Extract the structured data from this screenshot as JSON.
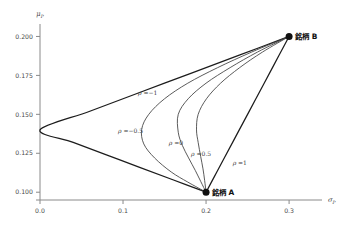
{
  "chart_data": {
    "type": "line",
    "title": "",
    "xlabel": "σP",
    "ylabel": "μP",
    "xlim": [
      0.0,
      0.33
    ],
    "ylim": [
      0.095,
      0.208
    ],
    "grid": false,
    "legend_position": "inline-annotations",
    "x_ticks": [
      "0.0",
      "0.1",
      "0.2",
      "0.3"
    ],
    "x_tick_values": [
      0.0,
      0.1,
      0.2,
      0.3
    ],
    "y_ticks": [
      "0.100",
      "0.125",
      "0.150",
      "0.175",
      "0.200"
    ],
    "y_tick_values": [
      0.1,
      0.125,
      0.15,
      0.175,
      0.2
    ],
    "points": [
      {
        "name": "銘柄 A",
        "x": 0.2,
        "y": 0.1
      },
      {
        "name": "銘柄 B",
        "x": 0.3,
        "y": 0.2
      }
    ],
    "series": [
      {
        "name": "ρ = −1",
        "rho": -1,
        "label": "ρ =−1",
        "x": [
          0.3,
          0.24,
          0.18,
          0.12,
          0.06,
          0.0,
          0.04,
          0.08,
          0.12,
          0.16,
          0.2
        ],
        "y": [
          0.2,
          0.188,
          0.176,
          0.164,
          0.152,
          0.14,
          0.132,
          0.124,
          0.116,
          0.108,
          0.1
        ]
      },
      {
        "name": "ρ = −0.5",
        "rho": -0.5,
        "label": "ρ =−0.5",
        "x": [
          0.3,
          0.255,
          0.214,
          0.178,
          0.15,
          0.131,
          0.1225,
          0.125,
          0.138,
          0.158,
          0.178,
          0.2
        ],
        "y": [
          0.2,
          0.19,
          0.18,
          0.17,
          0.16,
          0.15,
          0.1405,
          0.131,
          0.122,
          0.113,
          0.1065,
          0.1
        ]
      },
      {
        "name": "ρ = 0",
        "rho": 0,
        "label": "ρ =0",
        "x": [
          0.3,
          0.262,
          0.229,
          0.2,
          0.1785,
          0.1665,
          0.1665,
          0.1715,
          0.179,
          0.187,
          0.1935,
          0.2
        ],
        "y": [
          0.2,
          0.19,
          0.18,
          0.17,
          0.16,
          0.15,
          0.1385,
          0.13,
          0.122,
          0.114,
          0.107,
          0.1
        ]
      },
      {
        "name": "ρ = 0.5",
        "rho": 0.5,
        "label": "ρ =0.5",
        "x": [
          0.3,
          0.268,
          0.2405,
          0.2175,
          0.2005,
          0.1905,
          0.1885,
          0.1905,
          0.1935,
          0.1963,
          0.1983,
          0.2
        ],
        "y": [
          0.2,
          0.19,
          0.18,
          0.17,
          0.16,
          0.15,
          0.14,
          0.132,
          0.123,
          0.115,
          0.1075,
          0.1
        ]
      },
      {
        "name": "ρ = 1",
        "rho": 1,
        "label": "ρ =1",
        "x": [
          0.3,
          0.28,
          0.26,
          0.24,
          0.22,
          0.21,
          0.2
        ],
        "y": [
          0.2,
          0.18,
          0.16,
          0.14,
          0.12,
          0.11,
          0.1
        ]
      }
    ],
    "annotations": [
      {
        "text": "ρ =−1",
        "x": 0.118,
        "y": 0.1625
      },
      {
        "text": "ρ =−0.5",
        "x": 0.094,
        "y": 0.1378
      },
      {
        "text": "ρ =0",
        "x": 0.155,
        "y": 0.1305
      },
      {
        "text": "ρ =0.5",
        "x": 0.182,
        "y": 0.1232
      },
      {
        "text": "ρ =1",
        "x": 0.232,
        "y": 0.1175
      }
    ],
    "colors": {
      "axis": "#8a8a8a",
      "tick_text": "#4a4a4a",
      "curve": "#3d3d3d",
      "curve_bold": "#1c1c1c",
      "marker": "#101010",
      "background": "#ffffff"
    }
  }
}
